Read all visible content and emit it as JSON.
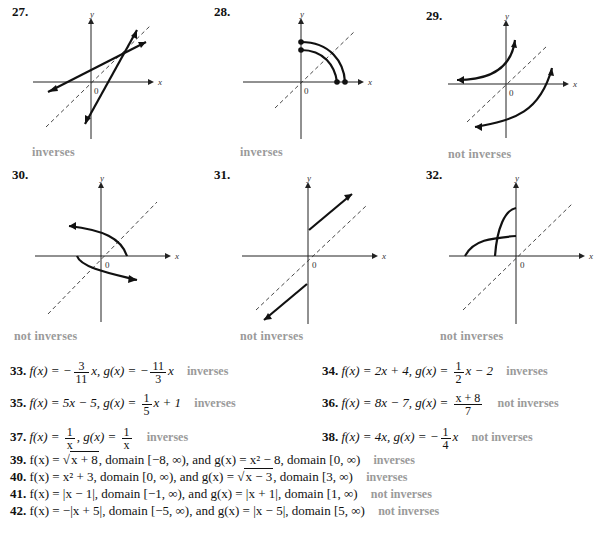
{
  "graphs": [
    {
      "number": "27.",
      "answer": "inverses"
    },
    {
      "number": "28.",
      "answer": "inverses"
    },
    {
      "number": "29.",
      "answer": "not inverses"
    },
    {
      "number": "30.",
      "answer": "not inverses"
    },
    {
      "number": "31.",
      "answer": "not inverses"
    },
    {
      "number": "32.",
      "answer": "not inverses"
    }
  ],
  "axis_labels": {
    "x": "x",
    "y": "y",
    "origin": "0"
  },
  "problems": [
    {
      "number": "33.",
      "f_prefix": "f(x) = −",
      "f_num": "3",
      "f_den": "11",
      "f_suffix": "x, g(x) = −",
      "g_num": "11",
      "g_den": "3",
      "g_suffix": "x",
      "answer": "inverses"
    },
    {
      "number": "34.",
      "f_prefix": "f(x) = 2x + 4, g(x) = ",
      "g_num": "1",
      "g_den": "2",
      "g_suffix": "x − 2",
      "answer": "inverses"
    },
    {
      "number": "35.",
      "f_prefix": "f(x) = 5x − 5, g(x) = ",
      "g_num": "1",
      "g_den": "5",
      "g_suffix": "x + 1",
      "answer": "inverses"
    },
    {
      "number": "36.",
      "f_prefix": "f(x) = 8x − 7, g(x) = ",
      "g_num": "x + 8",
      "g_den": "7",
      "g_suffix": "",
      "answer": "not inverses"
    },
    {
      "number": "37.",
      "f_prefix": "f(x) = ",
      "f_num": "1",
      "f_den": "x",
      "f_suffix": ", g(x) = ",
      "g_num": "1",
      "g_den": "x",
      "g_suffix": "",
      "answer": "inverses"
    },
    {
      "number": "38.",
      "f_prefix": "f(x) = 4x, g(x) = −",
      "g_num": "1",
      "g_den": "4",
      "g_suffix": "x",
      "answer": "not inverses"
    },
    {
      "number": "39.",
      "text_a": "f(x) = ",
      "sqrt": "x + 8",
      "text_b": ", domain [−8, ∞), and g(x) = x² − 8, domain [0, ∞)",
      "answer": "inverses"
    },
    {
      "number": "40.",
      "text_a": "f(x) = x² + 3, domain [0, ∞), and g(x) = ",
      "sqrt": "x − 3",
      "text_b": ", domain [3, ∞)",
      "answer": "inverses"
    },
    {
      "number": "41.",
      "text_a": "f(x) = |x − 1|, domain [−1, ∞), and g(x) = |x + 1|, domain [1, ∞)",
      "answer": "not inverses"
    },
    {
      "number": "42.",
      "text_a": "f(x) = −|x + 5|, domain [−5, ∞), and g(x) = |x − 5|, domain [5, ∞)",
      "answer": "not inverses"
    }
  ]
}
